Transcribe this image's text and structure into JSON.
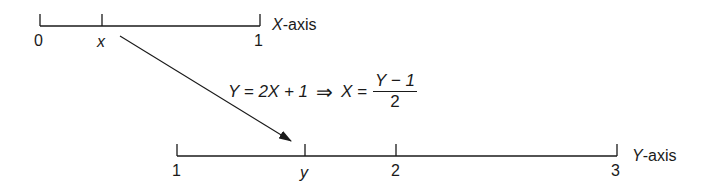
{
  "x_axis": {
    "label_var": "X",
    "label_suffix": "-axis",
    "ticks": [
      {
        "label": "0",
        "italic": false
      },
      {
        "label": "x",
        "italic": true
      },
      {
        "label": "1",
        "italic": false
      }
    ]
  },
  "y_axis": {
    "label_var": "Y",
    "label_suffix": "-axis",
    "ticks": [
      {
        "label": "1",
        "italic": false
      },
      {
        "label": "y",
        "italic": true
      },
      {
        "label": "2",
        "italic": false
      },
      {
        "label": "3",
        "italic": false
      }
    ]
  },
  "equation": {
    "lhs": "Y = 2X + 1",
    "implies": "⇒",
    "rhs_prefix": "X =",
    "numerator": "Y − 1",
    "denominator": "2"
  },
  "arrow": {
    "from": "x",
    "to": "y"
  }
}
